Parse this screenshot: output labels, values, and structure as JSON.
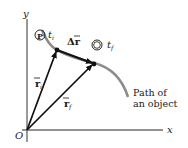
{
  "figure": {
    "axes": {
      "x_label": "x",
      "y_label": "y",
      "origin_label": "O"
    },
    "points": [
      {
        "id": "P",
        "label": "P",
        "time_label": "t",
        "time_sub": "i"
      },
      {
        "id": "Q",
        "label": "Q",
        "time_label": "t",
        "time_sub": "f"
      }
    ],
    "vectors": {
      "r_initial": {
        "label": "r",
        "sub": "i"
      },
      "r_final": {
        "label": "r",
        "sub": "f"
      },
      "displacement": {
        "label": "Δr"
      }
    },
    "path_label_line1": "Path of",
    "path_label_line2": "an object"
  },
  "colors": {
    "axis": "#6e6e6e",
    "vector": "#111111",
    "path": "#8c8c8c",
    "text": "#1a1a1a"
  }
}
